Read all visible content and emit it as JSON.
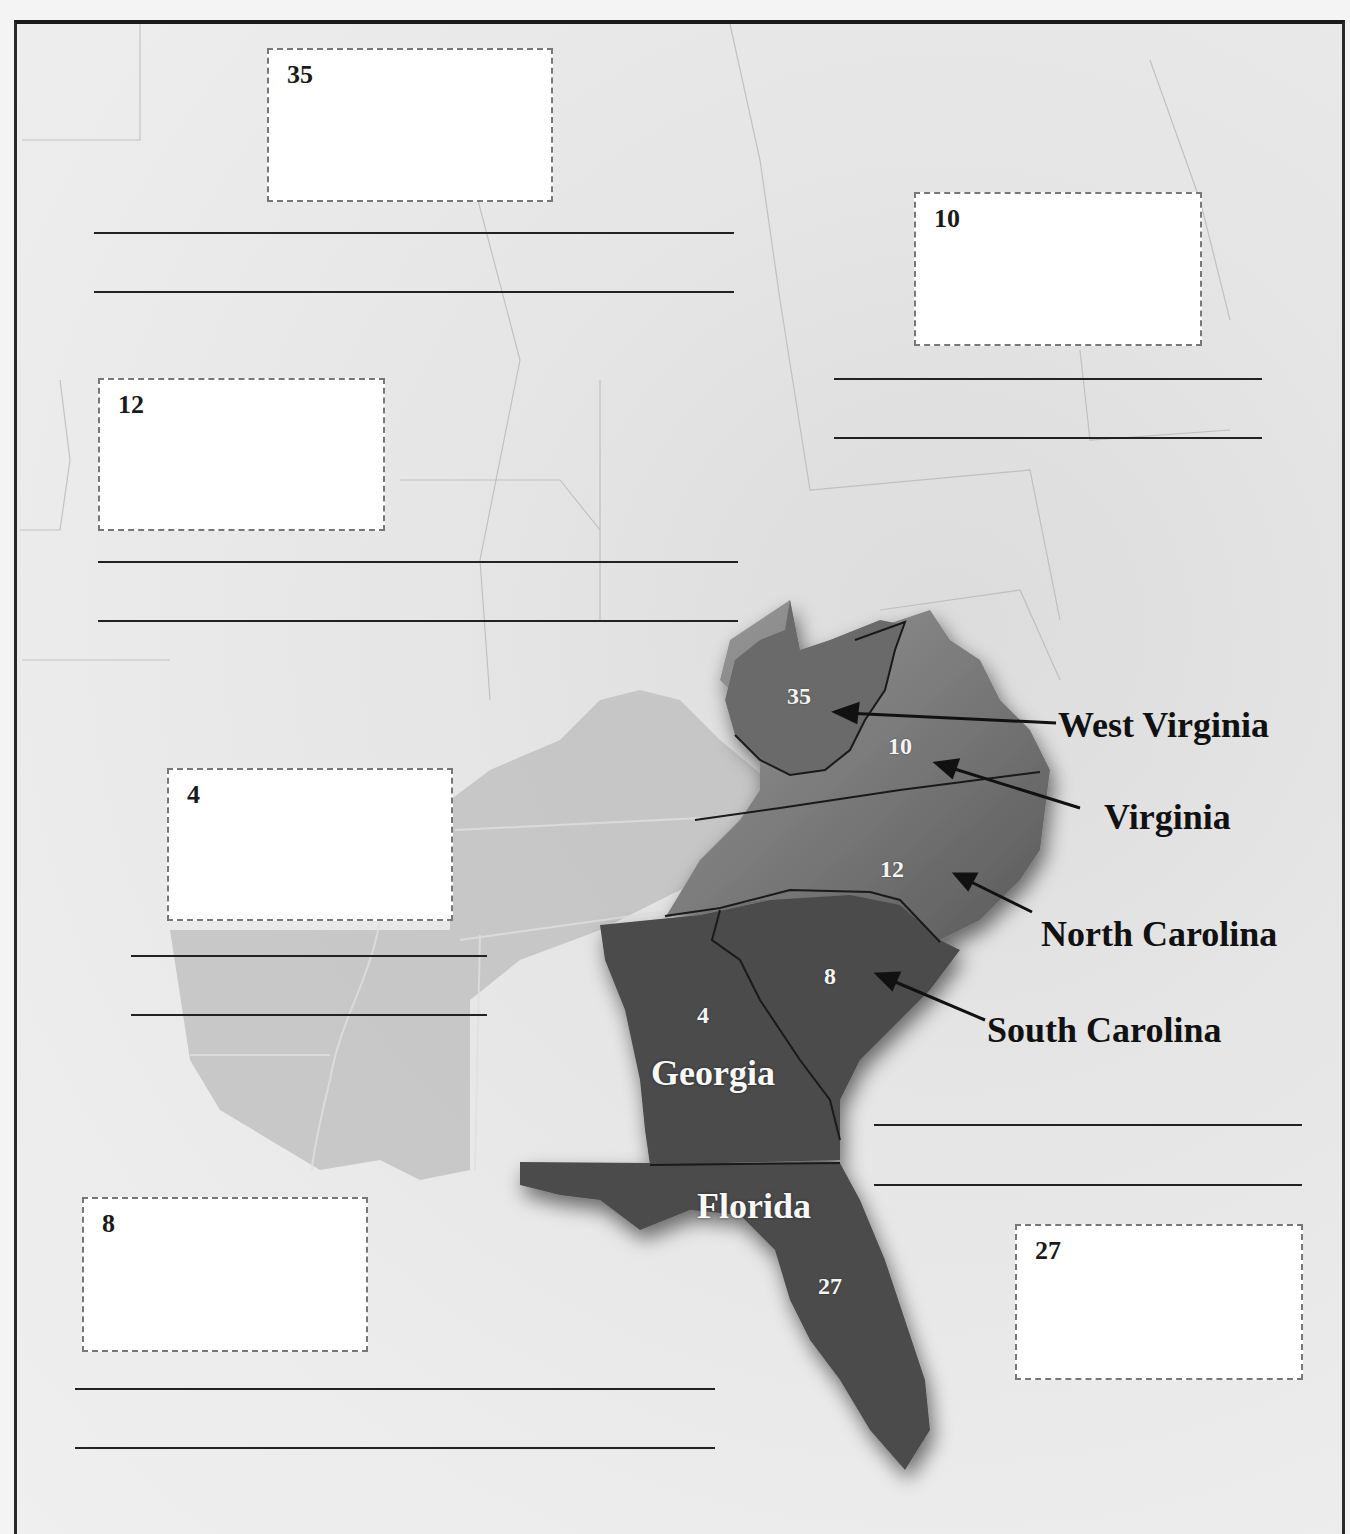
{
  "worksheet": {
    "colors": {
      "highlight_states": "#4a4a4a",
      "background_land": "#e8e8e8",
      "answer_box_border": "#777777",
      "answer_line": "#222222"
    },
    "answer_boxes": [
      {
        "number": "35",
        "x": 267,
        "y": 48,
        "w": 286,
        "h": 154
      },
      {
        "number": "10",
        "x": 914,
        "y": 192,
        "w": 288,
        "h": 154
      },
      {
        "number": "12",
        "x": 98,
        "y": 378,
        "w": 287,
        "h": 153
      },
      {
        "number": "4",
        "x": 167,
        "y": 768,
        "w": 286,
        "h": 153
      },
      {
        "number": "8",
        "x": 82,
        "y": 1197,
        "w": 286,
        "h": 155
      },
      {
        "number": "27",
        "x": 1015,
        "y": 1224,
        "w": 288,
        "h": 156
      }
    ],
    "answer_lines": [
      {
        "x": 94,
        "y": 232,
        "w": 640
      },
      {
        "x": 94,
        "y": 291,
        "w": 640
      },
      {
        "x": 834,
        "y": 378,
        "w": 428
      },
      {
        "x": 834,
        "y": 437,
        "w": 428
      },
      {
        "x": 98,
        "y": 561,
        "w": 640
      },
      {
        "x": 98,
        "y": 620,
        "w": 640
      },
      {
        "x": 131,
        "y": 955,
        "w": 356
      },
      {
        "x": 131,
        "y": 1014,
        "w": 356
      },
      {
        "x": 874,
        "y": 1124,
        "w": 428
      },
      {
        "x": 874,
        "y": 1184,
        "w": 428
      },
      {
        "x": 75,
        "y": 1388,
        "w": 640
      },
      {
        "x": 75,
        "y": 1447,
        "w": 640
      }
    ],
    "state_numbers": [
      {
        "label": "35",
        "x": 787,
        "y": 683
      },
      {
        "label": "10",
        "x": 888,
        "y": 733
      },
      {
        "label": "12",
        "x": 880,
        "y": 856
      },
      {
        "label": "8",
        "x": 824,
        "y": 963
      },
      {
        "label": "4",
        "x": 697,
        "y": 1002
      },
      {
        "label": "27",
        "x": 818,
        "y": 1273
      }
    ],
    "states_in_map": [
      {
        "label": "Georgia",
        "x": 651,
        "y": 1052
      },
      {
        "label": "Florida",
        "x": 697,
        "y": 1185
      }
    ],
    "callouts": [
      {
        "label": "West Virginia",
        "x": 1058,
        "y": 704
      },
      {
        "label": "Virginia",
        "x": 1104,
        "y": 796
      },
      {
        "label": "North Carolina",
        "x": 1041,
        "y": 913
      },
      {
        "label": "South Carolina",
        "x": 987,
        "y": 1009
      }
    ]
  }
}
